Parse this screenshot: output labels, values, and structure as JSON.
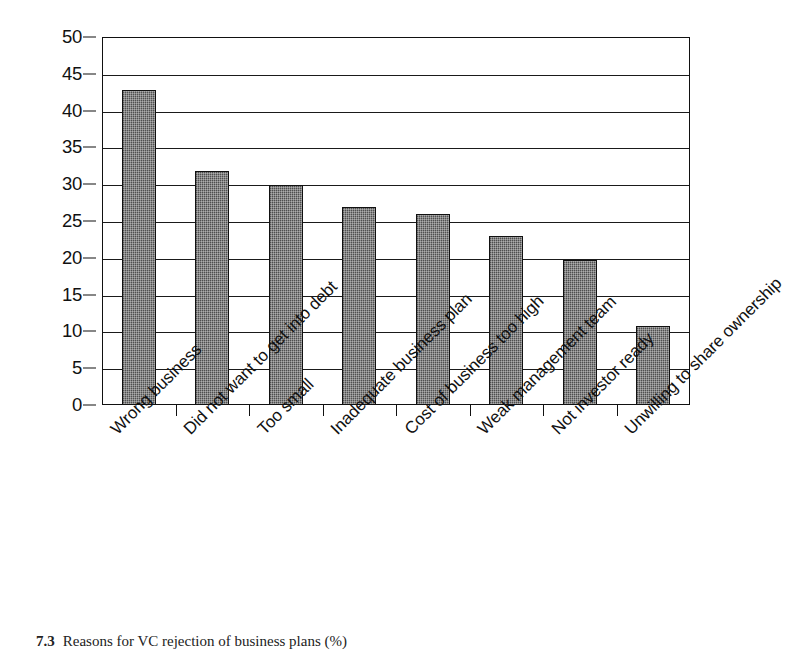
{
  "chart_data": {
    "type": "bar",
    "title": "",
    "xlabel": "",
    "ylabel": "",
    "ylim": [
      0,
      50
    ],
    "ytick_step": 5,
    "yticks": [
      50,
      45,
      40,
      35,
      30,
      25,
      20,
      15,
      10,
      5,
      0
    ],
    "grid": true,
    "legend": "none",
    "bar_color": "#6e6e6e",
    "bar_edge_color": "#111111",
    "axis_color": "#111111",
    "background": "#ffffff",
    "xtick_label_rotation": -45,
    "categories": [
      "Wrong business",
      "Did not want to get into debt",
      "Too small",
      "Inadequate business plan",
      "Cost of business too high",
      "Weak management team",
      "Not investor ready",
      "Unwilling to share ownership"
    ],
    "values": [
      42.8,
      31.8,
      29.9,
      26.9,
      26.0,
      22.9,
      19.7,
      10.7
    ]
  },
  "caption": {
    "number": "7.3",
    "text": "Reasons for VC rejection of business plans (%)"
  }
}
